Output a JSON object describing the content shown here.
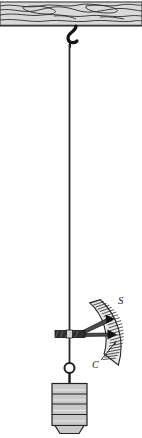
{
  "figure": {
    "background_color": "#ffffff",
    "ink_color": "#1a1a1a"
  },
  "beam": {
    "name": "wooden beam",
    "fill_color": "#d8d8d8",
    "edge_color": "#3a3a3a",
    "grain_color": "#2b2b2b",
    "x": 0,
    "y": 2,
    "width": 142,
    "height": 24
  },
  "hook": {
    "name": "s-hook",
    "color": "#141414",
    "x": 66,
    "y": 24,
    "width": 14,
    "height": 22
  },
  "wire": {
    "name": "suspension wire",
    "color": "#2a2a2a",
    "x": 69,
    "top": 44,
    "bottom": 366,
    "width": 2
  },
  "clamp": {
    "name": "pointer clamp block",
    "fill_color": "#2e2e2e",
    "x": 55,
    "y": 331,
    "width": 30,
    "height": 7
  },
  "pointers": [
    {
      "name": "upper pointer",
      "tip_x": 113,
      "tip_y": 318
    },
    {
      "name": "lower pointer",
      "tip_x": 116,
      "tip_y": 335
    }
  ],
  "scale": {
    "name": "graduated arc scale",
    "label": "S",
    "fill_color": "#e6e6e6",
    "edge_color": "#2a2a2a",
    "tick_color": "#2a2a2a",
    "tick_count": 22,
    "center_x": 63,
    "center_y": 333,
    "inner_radius": 50,
    "outer_radius": 64,
    "start_angle_deg": -42,
    "end_angle_deg": 30
  },
  "callout": {
    "name": "scale callout",
    "label": "C",
    "line_from_x": 101,
    "line_from_y": 360,
    "line_to_x": 117,
    "line_to_y": 341
  },
  "weight": {
    "name": "slotted hanging weight",
    "ring_center_x": 69,
    "ring_center_y": 368,
    "ring_radius": 5,
    "body_x": 52,
    "body_y": 383,
    "body_width": 35,
    "body_height": 42,
    "fill_color": "#c9c9c9",
    "edge_color": "#2a2a2a",
    "slab_count": 4,
    "foot_height": 9
  },
  "labels": {
    "scale": "S",
    "callout": "C"
  }
}
